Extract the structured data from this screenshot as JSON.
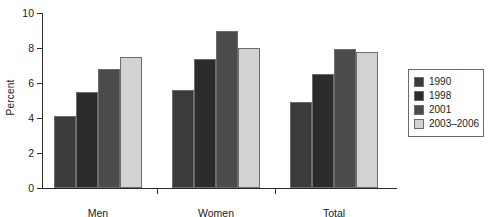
{
  "chart_data": {
    "type": "bar",
    "title": "",
    "subtitle": "",
    "xlabel": "",
    "ylabel": "Percent",
    "categories": [
      "Men",
      "Women",
      "Total"
    ],
    "series": [
      {
        "name": "1990",
        "color": "#3b3b3b",
        "values": [
          4.1,
          5.6,
          4.9
        ]
      },
      {
        "name": "1998",
        "color": "#2c2c2c",
        "values": [
          5.5,
          7.4,
          6.5
        ]
      },
      {
        "name": "2001",
        "color": "#4b4b4b",
        "values": [
          6.8,
          8.95,
          7.95
        ]
      },
      {
        "name": "2003–2006",
        "color": "#d2d2d2",
        "values": [
          7.5,
          8.0,
          7.75
        ]
      }
    ],
    "ylim": [
      0,
      10
    ],
    "yticks": [
      0,
      2,
      4,
      6,
      8,
      10
    ],
    "ytick_labels": [
      "0",
      "2",
      "4",
      "6",
      "8",
      "10"
    ],
    "grid": false,
    "legend_position": "right",
    "axis_color": "#2b2b2b",
    "bar_edge_color": "#6d6d6d",
    "background": "#ffffff"
  }
}
